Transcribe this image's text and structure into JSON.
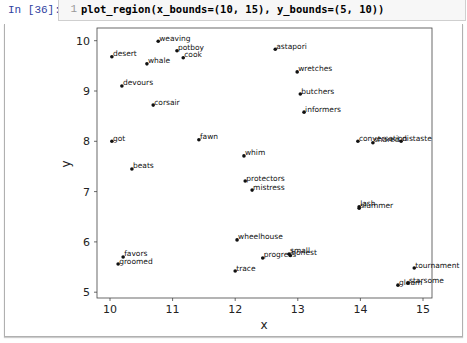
{
  "cell": {
    "prompt": "In [36]:",
    "line_number": "1",
    "code": "plot_region(x_bounds=(10, 15), y_bounds=(5, 10))"
  },
  "chart_data": {
    "type": "scatter",
    "title": "",
    "xlabel": "x",
    "ylabel": "y",
    "xlim": [
      9.8,
      15.15
    ],
    "ylim": [
      4.9,
      10.25
    ],
    "x_ticks": [
      "10",
      "11",
      "12",
      "13",
      "14",
      "15"
    ],
    "y_ticks": [
      "5",
      "6",
      "7",
      "8",
      "9",
      "10"
    ],
    "grid": false,
    "legend": null,
    "points": [
      {
        "label": "weaving",
        "x": 10.77,
        "y": 9.99
      },
      {
        "label": "potboy",
        "x": 11.07,
        "y": 9.8
      },
      {
        "label": "cook",
        "x": 11.17,
        "y": 9.66
      },
      {
        "label": "desert",
        "x": 10.03,
        "y": 9.68
      },
      {
        "label": "whale",
        "x": 10.59,
        "y": 9.54
      },
      {
        "label": "devours",
        "x": 10.19,
        "y": 9.1
      },
      {
        "label": "corsair",
        "x": 10.69,
        "y": 8.72
      },
      {
        "label": "astapori",
        "x": 12.64,
        "y": 9.83
      },
      {
        "label": "wretches",
        "x": 12.99,
        "y": 9.38
      },
      {
        "label": "butchers",
        "x": 13.04,
        "y": 8.94
      },
      {
        "label": "informers",
        "x": 13.1,
        "y": 8.58
      },
      {
        "label": "got",
        "x": 10.03,
        "y": 8.0
      },
      {
        "label": "fawn",
        "x": 11.42,
        "y": 8.03
      },
      {
        "label": "beats",
        "x": 10.35,
        "y": 7.45
      },
      {
        "label": "whim",
        "x": 12.14,
        "y": 7.71
      },
      {
        "label": "protectors",
        "x": 12.16,
        "y": 7.21
      },
      {
        "label": "mistress",
        "x": 12.27,
        "y": 7.03
      },
      {
        "label": "conversation",
        "x": 13.96,
        "y": 8.0
      },
      {
        "label": "shared",
        "x": 14.2,
        "y": 7.97
      },
      {
        "label": "distaste",
        "x": 14.65,
        "y": 8.0
      },
      {
        "label": "lash",
        "x": 13.98,
        "y": 6.7
      },
      {
        "label": "slummer",
        "x": 13.98,
        "y": 6.67
      },
      {
        "label": "wheelhouse",
        "x": 12.03,
        "y": 6.04
      },
      {
        "label": "favors",
        "x": 10.21,
        "y": 5.7
      },
      {
        "label": "groomed",
        "x": 10.13,
        "y": 5.56
      },
      {
        "label": "progress",
        "x": 12.44,
        "y": 5.68
      },
      {
        "label": "small",
        "x": 12.86,
        "y": 5.76
      },
      {
        "label": "honest",
        "x": 12.88,
        "y": 5.73
      },
      {
        "label": "trace",
        "x": 12.0,
        "y": 5.42
      },
      {
        "label": "tournament",
        "x": 14.86,
        "y": 5.48
      },
      {
        "label": "gleam",
        "x": 14.6,
        "y": 5.14
      },
      {
        "label": "starsome",
        "x": 14.76,
        "y": 5.18
      }
    ]
  }
}
